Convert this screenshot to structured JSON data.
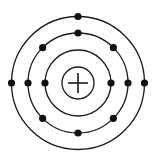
{
  "diagram": {
    "type": "bohr-atom-model",
    "background": "#ffffff",
    "stroke_color": "#1a1a1a",
    "electron_color": "#111111",
    "center": [
      78,
      83
    ],
    "nucleus": {
      "radius": 16,
      "symbol": "plus-icon",
      "charge_label": "+"
    },
    "electron_radius": 3.6,
    "shells": [
      {
        "name": "inner-shell",
        "radius": 33,
        "electron_count": 2,
        "electron_angles": [
          0,
          180
        ]
      },
      {
        "name": "middle-shell",
        "radius": 50,
        "electron_count": 8,
        "electron_angles": [
          0,
          45,
          90,
          135,
          180,
          225,
          270,
          315
        ]
      },
      {
        "name": "outer-shell",
        "radius": 66.5,
        "electron_count": 3,
        "electron_angles": [
          0,
          90,
          180
        ]
      }
    ],
    "total_electrons": 13
  }
}
